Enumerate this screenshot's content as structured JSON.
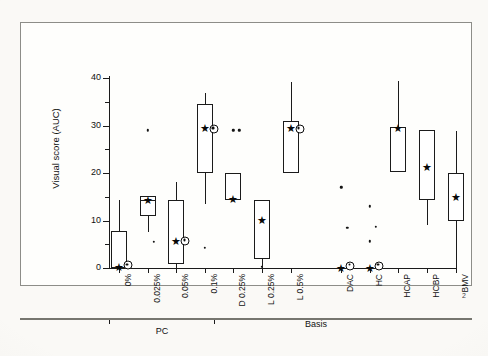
{
  "page": {
    "number": "2"
  },
  "figure": {
    "y_axis_title": "Visual score (AUC)",
    "y_ticks": [
      {
        "value": 0,
        "label": "0"
      },
      {
        "value": 10,
        "label": "10"
      },
      {
        "value": 20,
        "label": "20"
      },
      {
        "value": 30,
        "label": "30"
      },
      {
        "value": 40,
        "label": "40"
      }
    ],
    "y_minor_ticks": [
      5,
      15,
      25,
      35
    ],
    "groups": [
      {
        "label": "PC",
        "from": 0,
        "to": 3
      },
      {
        "label": "Basis",
        "from": 6,
        "to": 7
      }
    ]
  },
  "chart_data": {
    "type": "box",
    "title": "",
    "xlabel": "",
    "ylabel": "Visual score (AUC)",
    "ylim": [
      0,
      42
    ],
    "grid": false,
    "legend": "none",
    "categories": [
      "0%",
      "0.025%",
      "0.05%",
      "0.1%",
      "D 0.25%",
      "L 0.25%",
      "L 0.5%",
      "DAC",
      "HC",
      "HCAP",
      "HCBP",
      "BMV"
    ],
    "group_brackets": [
      {
        "label": "PC",
        "categories": [
          "0%",
          "0.025%",
          "0.05%",
          "0.1%"
        ]
      },
      {
        "label": "Basis",
        "categories": [
          "DAC",
          "HC"
        ]
      }
    ],
    "boxes": [
      {
        "category": "0%",
        "whisker_low": 0,
        "q1": 0,
        "median": 0,
        "q3": 7.8,
        "whisker_high": 14.3,
        "mean": 0.2,
        "marker2": 0.6,
        "outliers": []
      },
      {
        "category": "0.025%",
        "whisker_low": 7.5,
        "q1": 10.9,
        "median": 14.4,
        "q3": 15.1,
        "whisker_high": 15.1,
        "mean": 14.4,
        "marker2": null,
        "outliers": [
          29.0,
          5.5
        ]
      },
      {
        "category": "0.05%",
        "whisker_low": 0,
        "q1": 0.9,
        "median": 0.9,
        "q3": 14.3,
        "whisker_high": 18.2,
        "mean": 5.7,
        "marker2": 5.7,
        "outliers": []
      },
      {
        "category": "0.1%",
        "whisker_low": 13.4,
        "q1": 20.0,
        "median": 34.6,
        "q3": 34.6,
        "whisker_high": 36.9,
        "mean": 29.4,
        "marker2": 29.3,
        "outliers": [
          4.2
        ]
      },
      {
        "category": "D 0.25%",
        "whisker_low": 14.4,
        "q1": 14.4,
        "median": 20.0,
        "q3": 20.0,
        "whisker_high": 20.0,
        "mean": 14.6,
        "marker2": null,
        "outliers": [
          29.0,
          29.0
        ]
      },
      {
        "category": "L 0.25%",
        "whisker_low": 0,
        "q1": 1.9,
        "median": 14.4,
        "q3": 14.4,
        "whisker_high": 14.4,
        "mean": 10.2,
        "marker2": null,
        "outliers": [
          0.3
        ]
      },
      {
        "category": "L 0.5%",
        "whisker_low": 20.0,
        "q1": 20.0,
        "median": 30.9,
        "q3": 30.9,
        "whisker_high": 39.2,
        "mean": 29.4,
        "marker2": 29.3,
        "outliers": []
      },
      {
        "category": "DAC",
        "whisker_low": 0,
        "q1": 0,
        "median": 0,
        "q3": 0,
        "whisker_high": 0,
        "mean": 0.1,
        "marker2": 0.5,
        "outliers": [
          17.0,
          8.5
        ]
      },
      {
        "category": "HC",
        "whisker_low": 0,
        "q1": 0,
        "median": 0,
        "q3": 0,
        "whisker_high": 0,
        "mean": 0.1,
        "marker2": 0.5,
        "outliers": [
          13.0,
          8.7,
          5.6
        ]
      },
      {
        "category": "HCAP",
        "whisker_low": 20.2,
        "q1": 20.2,
        "median": 29.6,
        "q3": 29.6,
        "whisker_high": 39.4,
        "mean": 29.4,
        "marker2": null,
        "outliers": []
      },
      {
        "category": "HCBP",
        "whisker_low": 9.0,
        "q1": 14.4,
        "median": 29.0,
        "q3": 29.0,
        "whisker_high": 29.0,
        "mean": 21.3,
        "marker2": null,
        "outliers": []
      },
      {
        "category": "BMV",
        "whisker_low": 0,
        "q1": 10.0,
        "median": 20.0,
        "q3": 20.0,
        "whisker_high": 28.8,
        "mean": 15.0,
        "marker2": null,
        "outliers": []
      }
    ]
  }
}
